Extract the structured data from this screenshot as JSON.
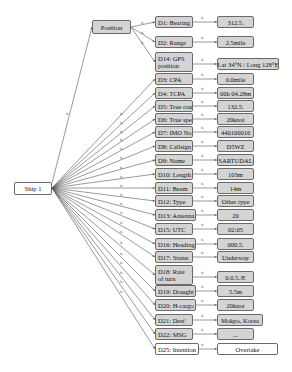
{
  "root": {
    "label": "Ship 1",
    "edge_label": "is"
  },
  "position": {
    "label": "Position"
  },
  "position_children": [
    {
      "id": "D1",
      "label": "D1: Bearing",
      "value": "312.5.",
      "y": 22
    },
    {
      "id": "D2",
      "label": "D2: Range",
      "value": "2.5mile",
      "y": 42
    },
    {
      "id": "D14",
      "label": "D14: GPS position",
      "value": "Lat 34°N / Long 128°E",
      "y": 62
    }
  ],
  "ship_children": [
    {
      "id": "D3",
      "label": "D3: CPA",
      "value": "0.0mile",
      "y": 79
    },
    {
      "id": "D4",
      "label": "D4: TCPA",
      "value": "00h 04.28m",
      "y": 93
    },
    {
      "id": "D5",
      "label": "D5: True course",
      "value": "132.5.",
      "y": 106
    },
    {
      "id": "D6",
      "label": "D6: True speed",
      "value": "20knot",
      "y": 119
    },
    {
      "id": "D7",
      "label": "D7: IMO No.",
      "value": "440100016",
      "y": 132
    },
    {
      "id": "D8",
      "label": "D8: Callsign",
      "value": "D5WZ",
      "y": 146
    },
    {
      "id": "D9",
      "label": "D9: Name",
      "value": "SARTUDAL",
      "y": 160
    },
    {
      "id": "D10",
      "label": "D10: Length",
      "value": "103m",
      "y": 174
    },
    {
      "id": "D11",
      "label": "D11: Beam",
      "value": "14m",
      "y": 188
    },
    {
      "id": "D12",
      "label": "D12: Type",
      "value": "Other type",
      "y": 201
    },
    {
      "id": "D13",
      "label": "D13: Antenna",
      "value": "20",
      "y": 215
    },
    {
      "id": "D15",
      "label": "D15: UTC",
      "value": "02:05",
      "y": 229
    },
    {
      "id": "D16",
      "label": "D16: Heading",
      "value": "000.5.",
      "y": 244
    },
    {
      "id": "D17",
      "label": "D17: Status",
      "value": "Underway",
      "y": 257
    },
    {
      "id": "D18",
      "label": "D18: Rate of turn",
      "value": "0.0.5./E",
      "y": 275
    },
    {
      "id": "D19",
      "label": "D19: Draught",
      "value": "5.5m",
      "y": 291
    },
    {
      "id": "D20",
      "label": "D20: H-cargo",
      "value": "20knot",
      "y": 305
    },
    {
      "id": "D21",
      "label": "D21: Dest'",
      "value": "Mokpo, Korea",
      "y": 320
    },
    {
      "id": "D22",
      "label": "D22: MSG",
      "value": "...",
      "y": 334
    },
    {
      "id": "D25",
      "label": "D25: Intention",
      "value": "Overtake",
      "y": 349,
      "highlight": "white"
    }
  ],
  "colors": {
    "node_fill": "#d4d4d4",
    "node_border": "#6a6a6a",
    "line": "#555555",
    "root_fill": "#ffffff"
  }
}
